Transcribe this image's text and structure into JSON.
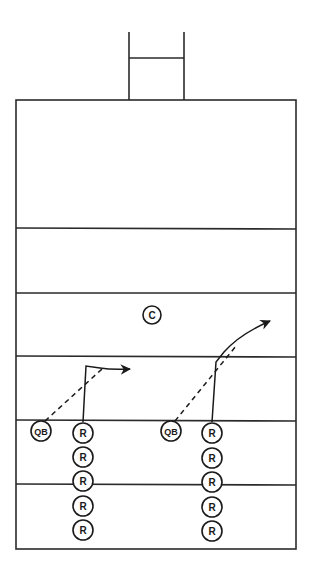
{
  "diagram": {
    "type": "football-play-diagram",
    "colors": {
      "line": "#2a2a2a",
      "ink": "#1a1a1a",
      "background": "#ffffff"
    },
    "goalpost": {
      "left_x": 129,
      "right_x": 184,
      "top_y": 32,
      "crossbar_y": 58,
      "base_y": 100
    },
    "field": {
      "left": 16,
      "right": 296,
      "top": 100,
      "bottom": 549,
      "yard_lines_y": [
        228,
        293,
        356,
        420,
        484
      ]
    },
    "players": {
      "center": {
        "label": "C",
        "x": 152,
        "y": 315
      },
      "qb_left": {
        "label": "QB",
        "x": 41,
        "y": 431
      },
      "qb_right": {
        "label": "QB",
        "x": 171,
        "y": 431
      },
      "receivers_left": [
        {
          "label": "R",
          "x": 83,
          "y": 433
        },
        {
          "label": "R",
          "x": 83,
          "y": 457
        },
        {
          "label": "R",
          "x": 83,
          "y": 481
        },
        {
          "label": "R",
          "x": 83,
          "y": 506
        },
        {
          "label": "R",
          "x": 83,
          "y": 530
        }
      ],
      "receivers_right": [
        {
          "label": "R",
          "x": 212,
          "y": 433
        },
        {
          "label": "R",
          "x": 212,
          "y": 458
        },
        {
          "label": "R",
          "x": 212,
          "y": 482
        },
        {
          "label": "R",
          "x": 212,
          "y": 507
        },
        {
          "label": "R",
          "x": 212,
          "y": 531
        }
      ]
    },
    "routes": {
      "left": {
        "description": "Out route: receiver runs up then breaks right",
        "pass": "dashed from QB to break point"
      },
      "right": {
        "description": "Corner route: receiver runs up then angles up-right",
        "pass": "dashed from QB to break point"
      }
    }
  }
}
